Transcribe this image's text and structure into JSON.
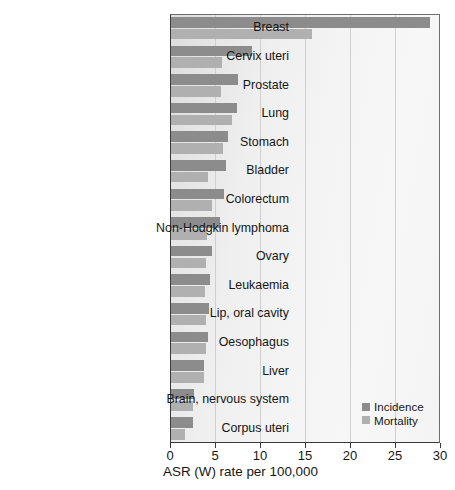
{
  "chart_data": {
    "type": "bar",
    "orientation": "horizontal",
    "title": "",
    "xlabel": "ASR (W) rate per 100,000",
    "ylabel": "",
    "xlim": [
      0,
      30
    ],
    "xticks": [
      0,
      5,
      10,
      15,
      20,
      25,
      30
    ],
    "xtick_labels": [
      "0",
      "5",
      "10",
      "15",
      "20",
      "25",
      "30"
    ],
    "grid": true,
    "legend_position": "bottom-right",
    "categories": [
      "Breast",
      "Cervix uteri",
      "Prostate",
      "Lung",
      "Stomach",
      "Bladder",
      "Colorectum",
      "Non-Hodgkin lymphoma",
      "Ovary",
      "Leukaemia",
      "Lip, oral cavity",
      "Oesophagus",
      "Liver",
      "Brain, nervous system",
      "Corpus uteri"
    ],
    "series": [
      {
        "name": "Incidence",
        "color": "#8c8c8c",
        "values": [
          28.9,
          9.1,
          7.6,
          7.4,
          6.4,
          6.2,
          6.0,
          5.5,
          4.7,
          4.4,
          4.3,
          4.2,
          3.8,
          2.7,
          2.5
        ]
      },
      {
        "name": "Mortality",
        "color": "#b0b0b0",
        "values": [
          15.8,
          5.8,
          5.7,
          6.9,
          5.9,
          4.2,
          4.7,
          4.1,
          4.0,
          3.9,
          4.0,
          4.0,
          3.8,
          2.5,
          1.7
        ]
      }
    ]
  },
  "legend": {
    "items": [
      {
        "label": "Incidence",
        "swatch": "incidence"
      },
      {
        "label": "Mortality",
        "swatch": "mortality"
      }
    ]
  }
}
